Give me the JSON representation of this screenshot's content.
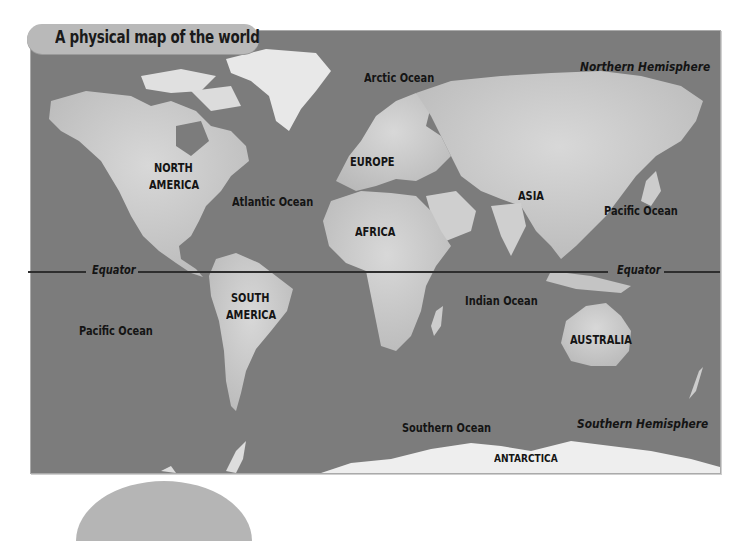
{
  "title": "A physical map of the world",
  "colors": {
    "ocean": "#7c7c7c",
    "land": "#c9c9c9",
    "land_high": "#e6e6e6",
    "title_tab": "#b9b9b9",
    "equator": "#2e2e2e",
    "text": "#141414"
  },
  "equator": {
    "left_label": "Equator",
    "right_label": "Equator"
  },
  "hemispheres": {
    "north": "Northern Hemisphere",
    "south": "Southern Hemisphere"
  },
  "continents": {
    "north_america_line1": "NORTH",
    "north_america_line2": "AMERICA",
    "south_america_line1": "SOUTH",
    "south_america_line2": "AMERICA",
    "europe": "EUROPE",
    "africa": "AFRICA",
    "asia": "ASIA",
    "australia": "AUSTRALIA",
    "antarctica": "ANTARCTICA"
  },
  "oceans": {
    "arctic": "Arctic Ocean",
    "atlantic": "Atlantic Ocean",
    "pacific_east": "Pacific Ocean",
    "pacific_west": "Pacific Ocean",
    "indian": "Indian Ocean",
    "southern": "Southern Ocean"
  }
}
